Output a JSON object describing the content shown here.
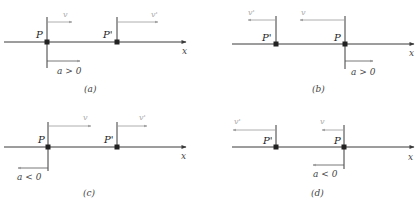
{
  "panels": [
    {
      "id": "a",
      "caption": "(a)",
      "axis": {
        "y": 42,
        "x1": 4,
        "x2": 186,
        "label": "x"
      },
      "P": {
        "x": 47,
        "label": "P"
      },
      "Pprime": {
        "x": 117,
        "label": "P'"
      },
      "v": {
        "label": "v",
        "direction": "right"
      },
      "vprime": {
        "label": "v'",
        "direction": "right"
      },
      "accel": {
        "label": "a > 0",
        "direction": "right",
        "below": true
      }
    },
    {
      "id": "b",
      "caption": "(b)",
      "axis": {
        "y": 44,
        "x1": 232,
        "x2": 414,
        "label": "x"
      },
      "P": {
        "x": 345,
        "label": "P"
      },
      "Pprime": {
        "x": 276,
        "label": "P'"
      },
      "v": {
        "label": "v",
        "direction": "left"
      },
      "vprime": {
        "label": "v'",
        "direction": "left"
      },
      "accel": {
        "label": "a > 0",
        "direction": "right",
        "below": true
      }
    },
    {
      "id": "c",
      "caption": "(c)",
      "axis": {
        "y": 147,
        "x1": 4,
        "x2": 186,
        "label": "x"
      },
      "P": {
        "x": 48,
        "label": "P"
      },
      "Pprime": {
        "x": 117,
        "label": "P'"
      },
      "v": {
        "label": "v",
        "direction": "right"
      },
      "vprime": {
        "label": "v'",
        "direction": "right"
      },
      "accel": {
        "label": "a < 0",
        "direction": "left",
        "below": true
      }
    },
    {
      "id": "d",
      "caption": "(d)",
      "axis": {
        "y": 147,
        "x1": 232,
        "x2": 414,
        "label": "x"
      },
      "P": {
        "x": 344,
        "label": "P"
      },
      "Pprime": {
        "x": 276,
        "label": "P'"
      },
      "v": {
        "label": "v",
        "direction": "left"
      },
      "vprime": {
        "label": "v'",
        "direction": "left"
      },
      "accel": {
        "label": "a < 0",
        "direction": "left",
        "below": true
      }
    }
  ]
}
